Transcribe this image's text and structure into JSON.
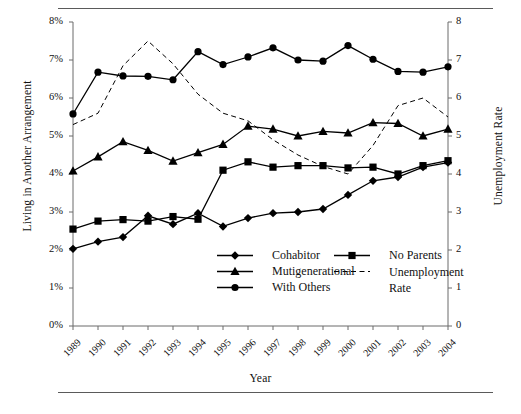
{
  "figure": {
    "xlabel": "Year",
    "ylabel_left": "Living in Another Arrangement",
    "ylabel_right": "Unemployment Rate"
  },
  "axes": {
    "y_left_ticks": [
      "0%",
      "1%",
      "2%",
      "3%",
      "4%",
      "5%",
      "6%",
      "7%",
      "8%"
    ],
    "y_right_ticks": [
      "0",
      "1",
      "2",
      "3",
      "4",
      "5",
      "6",
      "7",
      "8"
    ],
    "x_ticks": [
      "1989",
      "1990",
      "1991",
      "1992",
      "1993",
      "1994",
      "1995",
      "1996",
      "1997",
      "1998",
      "1999",
      "2000",
      "2001",
      "2002",
      "2003",
      "2004"
    ]
  },
  "legend": {
    "items": [
      {
        "label": "Cohabitor",
        "marker": "diamond",
        "style": "solid"
      },
      {
        "label": "Mutigenerational",
        "marker": "triangle",
        "style": "solid"
      },
      {
        "label": "With Others",
        "marker": "circle",
        "style": "solid"
      },
      {
        "label": "No Parents",
        "marker": "square",
        "style": "solid"
      },
      {
        "label": "Unemployment Rate",
        "marker": "none",
        "style": "dashed"
      }
    ]
  },
  "chart_data": {
    "type": "line",
    "title": "",
    "xlabel": "Year",
    "ylabel": "Living in Another Arrangement",
    "ylabel_secondary": "Unemployment Rate",
    "x": [
      1989,
      1990,
      1991,
      1992,
      1993,
      1994,
      1995,
      1996,
      1997,
      1998,
      1999,
      2000,
      2001,
      2002,
      2003,
      2004
    ],
    "ylim": [
      0,
      8
    ],
    "ylim_secondary": [
      0,
      8
    ],
    "grid": false,
    "legend_position": "lower-center",
    "series": [
      {
        "name": "Cohabitor",
        "marker": "diamond",
        "style": "solid",
        "axis": "left",
        "unit": "%",
        "values": [
          2.03,
          2.22,
          2.34,
          2.9,
          2.68,
          2.97,
          2.62,
          2.84,
          2.97,
          3.0,
          3.08,
          3.45,
          3.82,
          3.92,
          4.18,
          4.3
        ]
      },
      {
        "name": "Mutigenerational",
        "marker": "triangle",
        "style": "solid",
        "axis": "left",
        "unit": "%",
        "values": [
          4.08,
          4.45,
          4.85,
          4.62,
          4.34,
          4.56,
          4.78,
          5.26,
          5.18,
          5.0,
          5.12,
          5.08,
          5.35,
          5.33,
          5.0,
          5.18
        ]
      },
      {
        "name": "With Others",
        "marker": "circle",
        "style": "solid",
        "axis": "left",
        "unit": "%",
        "values": [
          5.58,
          6.68,
          6.58,
          6.57,
          6.48,
          7.22,
          6.88,
          7.08,
          7.32,
          7.0,
          6.97,
          7.38,
          7.02,
          6.7,
          6.68,
          6.82
        ]
      },
      {
        "name": "No Parents",
        "marker": "square",
        "style": "solid",
        "axis": "left",
        "unit": "%",
        "values": [
          2.55,
          2.76,
          2.8,
          2.76,
          2.88,
          2.81,
          4.1,
          4.32,
          4.18,
          4.22,
          4.22,
          4.16,
          4.18,
          4.0,
          4.22,
          4.35
        ]
      },
      {
        "name": "Unemployment Rate",
        "marker": "none",
        "style": "dashed",
        "axis": "right",
        "unit": "",
        "values": [
          5.3,
          5.6,
          6.85,
          7.5,
          6.9,
          6.1,
          5.6,
          5.4,
          4.9,
          4.5,
          4.2,
          4.0,
          4.75,
          5.8,
          6.0,
          5.5
        ]
      }
    ]
  },
  "caption": {
    "text": ""
  }
}
